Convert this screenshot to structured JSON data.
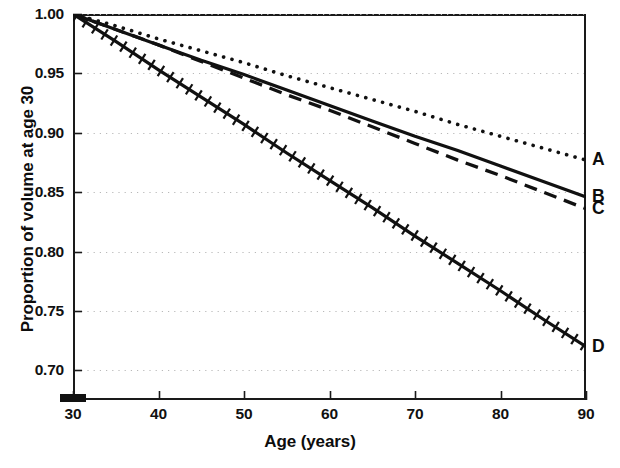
{
  "chart_data": {
    "type": "line",
    "title": "",
    "subtitle": "",
    "xlabel": "Age (years)",
    "ylabel": "Proportion of volume at age 30",
    "xlim": [
      30,
      90
    ],
    "ylim": [
      0.675,
      1.0
    ],
    "xticks": [
      30,
      40,
      50,
      60,
      70,
      80,
      90
    ],
    "xtick_labels": [
      "30",
      "40",
      "50",
      "60",
      "70",
      "80",
      "90"
    ],
    "yticks": [
      0.7,
      0.75,
      0.8,
      0.85,
      0.9,
      0.95,
      1.0
    ],
    "ytick_labels": [
      "0.70",
      "0.75",
      "0.80",
      "0.85",
      "0.90",
      "0.95",
      "1.00"
    ],
    "grid": "horizontal-dotted",
    "grid_color": "#b9b9b9",
    "legend_position": "right-endpoint-labels",
    "x": [
      30,
      35,
      40,
      45,
      50,
      55,
      60,
      65,
      70,
      75,
      80,
      85,
      90
    ],
    "series": [
      {
        "name": "A",
        "label": "A",
        "style": "dotted",
        "color": "#111111",
        "values": [
          1.0,
          0.99,
          0.979,
          0.969,
          0.959,
          0.948,
          0.938,
          0.928,
          0.918,
          0.907,
          0.897,
          0.887,
          0.877
        ],
        "end_value": 0.877
      },
      {
        "name": "B",
        "label": "B",
        "style": "solid",
        "color": "#111111",
        "values": [
          1.0,
          0.987,
          0.974,
          0.961,
          0.949,
          0.936,
          0.923,
          0.91,
          0.897,
          0.885,
          0.872,
          0.859,
          0.846
        ],
        "end_value": 0.846
      },
      {
        "name": "C",
        "label": "C",
        "style": "dashed",
        "color": "#111111",
        "values": [
          1.0,
          0.987,
          0.974,
          0.96,
          0.946,
          0.932,
          0.919,
          0.905,
          0.891,
          0.877,
          0.864,
          0.85,
          0.836
        ],
        "end_value": 0.836
      },
      {
        "name": "D",
        "label": "D",
        "style": "hatched",
        "color": "#111111",
        "values": [
          1.0,
          0.977,
          0.953,
          0.93,
          0.907,
          0.883,
          0.86,
          0.837,
          0.813,
          0.79,
          0.767,
          0.743,
          0.72
        ],
        "end_value": 0.72
      }
    ],
    "annotations": [
      {
        "name": "reference-marker",
        "type": "filled-rectangle",
        "x": 30,
        "y": 0.677,
        "color": "#111111"
      }
    ]
  }
}
